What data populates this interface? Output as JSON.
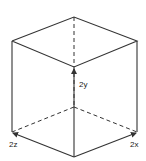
{
  "diagram": {
    "type": "cube",
    "colors": {
      "line": "#333333",
      "text": "#222222",
      "background": "#ffffff"
    },
    "labels": {
      "y": "2y",
      "z": "2z",
      "x": "2x"
    }
  }
}
